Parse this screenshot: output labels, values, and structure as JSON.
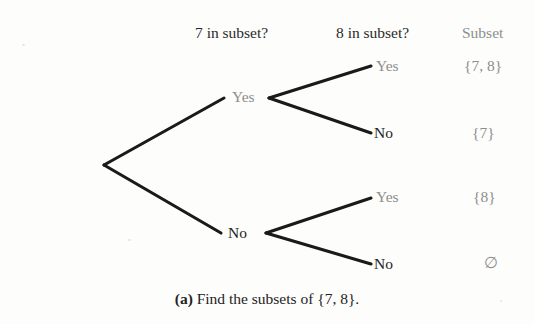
{
  "figure": {
    "caption_tag": "(a)",
    "caption_text": " Find the subsets of {7, 8}.",
    "background_color": "#fdfdfb",
    "edge_color": "#1a1a1a",
    "gray_text_color": "#8d8d8d",
    "dark_text_color": "#232323"
  },
  "headers": {
    "question_1": "7 in subset?",
    "question_2": "8 in subset?",
    "result": "Subset"
  },
  "tree": {
    "level1": [
      {
        "label": "Yes",
        "tone": "gray"
      },
      {
        "label": "No",
        "tone": "dark"
      }
    ],
    "level2": [
      {
        "label": "Yes",
        "tone": "gray"
      },
      {
        "label": "No",
        "tone": "dark"
      },
      {
        "label": "Yes",
        "tone": "gray"
      },
      {
        "label": "No",
        "tone": "dark"
      }
    ]
  },
  "results": [
    "{7, 8}",
    "{7}",
    "{8}",
    "∅"
  ]
}
